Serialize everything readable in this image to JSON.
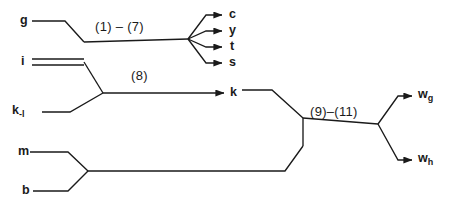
{
  "diagram": {
    "type": "process-flow-feynman",
    "background_color": "#ffffff",
    "line_color": "#1a1a1a",
    "text_color": "#1a1a1a",
    "inputs": [
      {
        "id": "g",
        "label": "g",
        "x": 20,
        "y": 16,
        "double_line": false
      },
      {
        "id": "i",
        "label": "i",
        "x": 20,
        "y": 62,
        "double_line": true
      },
      {
        "id": "k_l",
        "label": "k",
        "subscript": "-l",
        "x": 12,
        "y": 104,
        "double_line": false
      },
      {
        "id": "m",
        "label": "m",
        "x": 18,
        "y": 148,
        "double_line": false
      },
      {
        "id": "b",
        "label": "b",
        "x": 22,
        "y": 188,
        "double_line": false
      }
    ],
    "intermediates": [
      {
        "id": "k",
        "label": "k",
        "x": 232,
        "y": 93
      }
    ],
    "outputs": [
      {
        "id": "c",
        "label": "c",
        "x": 230,
        "y": 15
      },
      {
        "id": "y",
        "label": "y",
        "x": 230,
        "y": 31
      },
      {
        "id": "t",
        "label": "t",
        "x": 230,
        "y": 47
      },
      {
        "id": "s",
        "label": "s",
        "x": 230,
        "y": 63
      },
      {
        "id": "w_g",
        "label": "w",
        "subscript": "g",
        "x": 420,
        "y": 91
      },
      {
        "id": "w_h",
        "label": "w",
        "subscript": "h",
        "x": 420,
        "y": 155
      }
    ],
    "edge_labels": [
      {
        "id": "label-1-7",
        "text": "(1) – (7)",
        "x": 95,
        "y": 28
      },
      {
        "id": "label-8",
        "text": "(8)",
        "x": 131,
        "y": 76
      },
      {
        "id": "label-9-11",
        "text": "(9)–(11)",
        "x": 310,
        "y": 112
      }
    ]
  }
}
